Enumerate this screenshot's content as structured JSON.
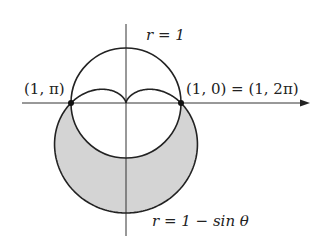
{
  "diagram": {
    "type": "polar-curves",
    "origin_px": [
      126,
      103
    ],
    "unit_px": 55,
    "colors": {
      "stroke": "#222222",
      "shade": "#d4d4d4",
      "background": "#ffffff"
    },
    "axes": {
      "horizontal": {
        "x1": 22,
        "x2": 310,
        "y": 103,
        "arrow": true
      },
      "vertical": {
        "x": 126,
        "y1": 24,
        "y2": 236
      }
    },
    "curves": [
      {
        "name": "circle",
        "equation": "r = 1"
      },
      {
        "name": "cardioid",
        "equation": "r = 1 − sin θ"
      }
    ],
    "shaded_region": "inside r = 1 − sin θ and outside r = 1",
    "points": [
      {
        "name": "left-intersection",
        "label": "(1, π)",
        "polar": [
          1,
          "π"
        ]
      },
      {
        "name": "right-intersection",
        "label": "(1, 0) = (1, 2π)",
        "polar": [
          1,
          0
        ]
      }
    ],
    "labels": {
      "circle_label": "r = 1",
      "cardioid_label": "r = 1 − sin θ",
      "left_point_label": "(1, π)",
      "right_point_label": "(1, 0) = (1, 2π)"
    }
  }
}
